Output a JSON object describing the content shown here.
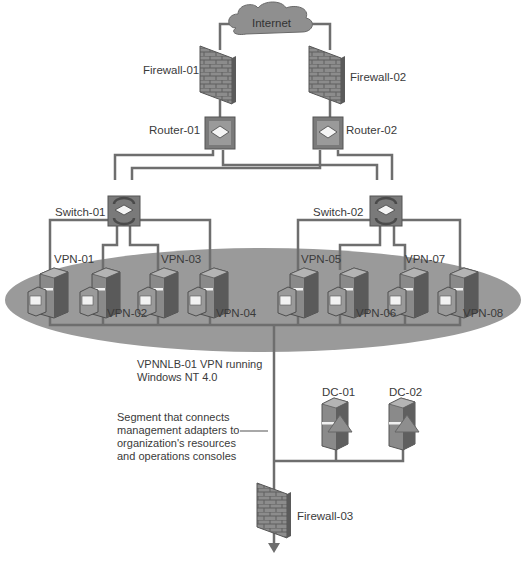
{
  "diagram": {
    "cloud": {
      "label": "Internet"
    },
    "firewalls": [
      {
        "id": "fw1",
        "label": "Firewall-01"
      },
      {
        "id": "fw2",
        "label": "Firewall-02"
      },
      {
        "id": "fw3",
        "label": "Firewall-03"
      }
    ],
    "routers": [
      {
        "id": "r1",
        "label": "Router-01"
      },
      {
        "id": "r2",
        "label": "Router-02"
      }
    ],
    "switches": [
      {
        "id": "s1",
        "label": "Switch-01"
      },
      {
        "id": "s2",
        "label": "Switch-02"
      }
    ],
    "vpn_servers": [
      {
        "label": "VPN-01"
      },
      {
        "label": "VPN-02"
      },
      {
        "label": "VPN-03"
      },
      {
        "label": "VPN-04"
      },
      {
        "label": "VPN-05"
      },
      {
        "label": "VPN-06"
      },
      {
        "label": "VPN-07"
      },
      {
        "label": "VPN-08"
      }
    ],
    "domain_controllers": [
      {
        "label": "DC-01"
      },
      {
        "label": "DC-02"
      }
    ],
    "cluster_caption_line1": "VPNNLB-01 VPN running",
    "cluster_caption_line2": "Windows NT 4.0",
    "segment_note": [
      "Segment that connects",
      "management adapters to",
      "organization's resources",
      "and operations consoles"
    ],
    "colors": {
      "line": "#6e6e6e",
      "cluster_ellipse": "#9a9a9a",
      "device_dark": "#5a5a5a",
      "device_mid": "#8a8a8a",
      "device_light": "#b4b4b4",
      "cloud": "#8f8f8f"
    }
  }
}
